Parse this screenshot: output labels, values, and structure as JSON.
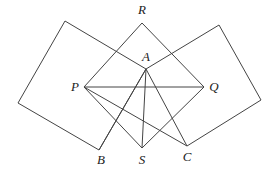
{
  "diagram": {
    "type": "geometry",
    "points": {
      "R": "R",
      "A": "A",
      "P": "P",
      "Q": "Q",
      "S": "S",
      "B": "B",
      "C": "C"
    },
    "segments": [
      [
        "P",
        "R"
      ],
      [
        "R",
        "Q"
      ],
      [
        "Q",
        "S"
      ],
      [
        "S",
        "P"
      ],
      [
        "P",
        "Q"
      ],
      [
        "P",
        "C"
      ],
      [
        "A",
        "S"
      ],
      [
        "A",
        "B"
      ]
    ],
    "squares": [
      {
        "name": "left-square",
        "includes": [
          "A",
          "B"
        ]
      },
      {
        "name": "right-square",
        "includes": [
          "A",
          "C"
        ]
      }
    ],
    "labels": [
      "R",
      "A",
      "P",
      "Q",
      "S",
      "B",
      "C"
    ]
  }
}
